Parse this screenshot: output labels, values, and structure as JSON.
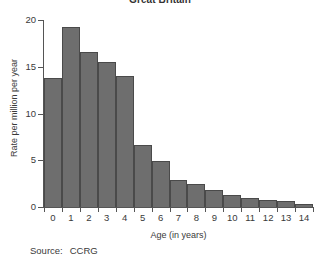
{
  "chart_data": {
    "type": "bar",
    "title": "Great Britain",
    "xlabel": "Age (in years)",
    "ylabel": "Rate per million per year",
    "categories": [
      "0",
      "1",
      "2",
      "3",
      "4",
      "5",
      "6",
      "7",
      "8",
      "9",
      "10",
      "11",
      "12",
      "13",
      "14"
    ],
    "values": [
      13.8,
      19.2,
      16.6,
      15.5,
      14.0,
      6.6,
      4.9,
      2.9,
      2.5,
      1.8,
      1.3,
      1.0,
      0.7,
      0.6,
      0.35
    ],
    "ylim": [
      0,
      20
    ],
    "yticks": [
      0,
      5,
      10,
      15,
      20
    ],
    "ytick_labels": [
      "0",
      "5",
      "10",
      "15",
      "20"
    ],
    "grid": false,
    "legend": "none",
    "bar_color": "#6e6e6e",
    "bar_edge_color": "#4a4a4a",
    "axis_color": "#555555"
  },
  "source": {
    "label": "Source:",
    "value": "CCRG"
  }
}
